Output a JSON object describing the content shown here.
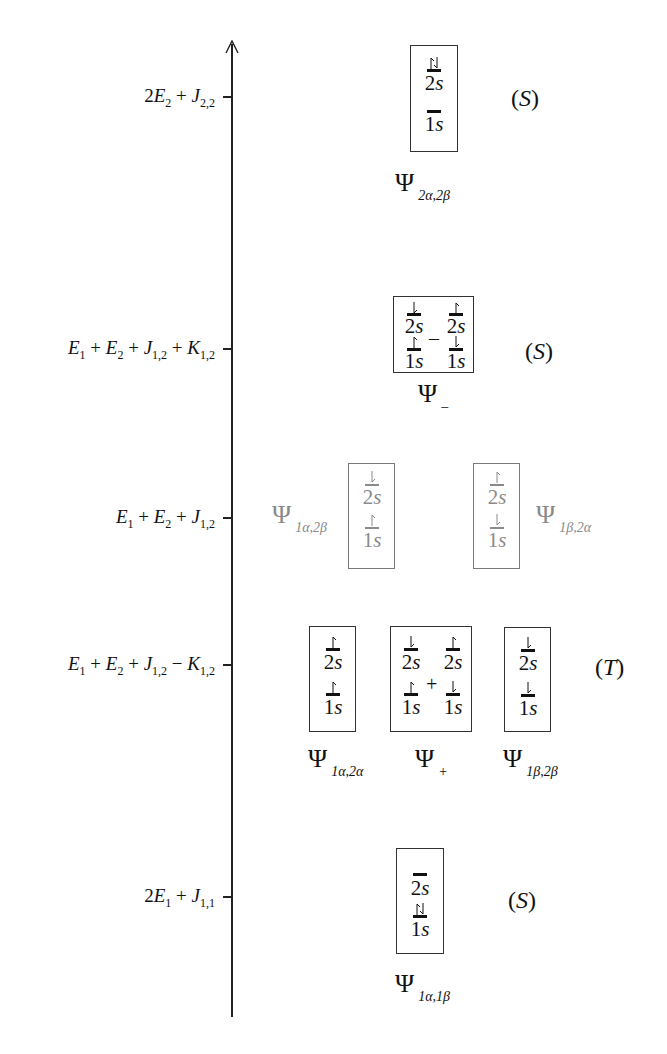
{
  "diagram": {
    "title": "",
    "axis": {
      "direction": "up",
      "meaning": "energy"
    },
    "energy_levels": [
      {
        "id": "level-2e2",
        "label_html": "2<i>E</i><sub>2</sub> + <i>J</i><sub>2,2</sub>",
        "label_text": "2E_2 + J_{2,2}",
        "y": 97
      },
      {
        "id": "level-singlet-minus",
        "label_text": "E_1 + E_2 + J_{1,2} + K_{1,2}",
        "y": 349
      },
      {
        "id": "level-coulomb",
        "label_text": "E_1 + E_2 + J_{1,2}",
        "y": 518
      },
      {
        "id": "level-triplet",
        "label_text": "E_1 + E_2 + J_{1,2} - K_{1,2}",
        "y": 665
      },
      {
        "id": "level-2e1",
        "label_text": "2E_1 + J_{1,1}",
        "y": 897
      }
    ],
    "label_parts": {
      "l0": [
        "2",
        "E",
        "2",
        " + ",
        "J",
        "2,2"
      ],
      "l1": [
        "E",
        "1",
        " + ",
        "E",
        "2",
        " + ",
        "J",
        "1,2",
        " + ",
        "K",
        "1,2"
      ],
      "l2": [
        "E",
        "1",
        " + ",
        "E",
        "2",
        " + ",
        "J",
        "1,2"
      ],
      "l3": [
        "E",
        "1",
        " + ",
        "E",
        "2",
        " + ",
        "J",
        "1,2",
        " − ",
        "K",
        "1,2"
      ],
      "l4": [
        "2",
        "E",
        "1",
        " + ",
        "J",
        "1,1"
      ]
    },
    "orbitals": {
      "upper": "2s",
      "lower": "1s",
      "upper_num": "2",
      "lower_num": "1",
      "letter": "s"
    },
    "operators": {
      "minus": "–",
      "plus": "+"
    },
    "states": [
      {
        "name": "Ψ",
        "subscript": "2α,2β",
        "multiplicity": "(S)",
        "config": {
          "2s": "↑↓",
          "1s": ""
        }
      },
      {
        "name": "Ψ",
        "subscript": "–",
        "multiplicity": "(S)",
        "config": "[2s↓,1s↑] – [2s↑,1s↓]"
      },
      {
        "name": "Ψ",
        "subscript": "1α,2β",
        "multiplicity": "",
        "config": {
          "2s": "↓",
          "1s": "↑"
        },
        "style": "gray"
      },
      {
        "name": "Ψ",
        "subscript": "1β,2α",
        "multiplicity": "",
        "config": {
          "2s": "↑",
          "1s": "↓"
        },
        "style": "gray"
      },
      {
        "name": "Ψ",
        "subscript": "1α,2α",
        "multiplicity": "(T)",
        "config": {
          "2s": "↑",
          "1s": "↑"
        }
      },
      {
        "name": "Ψ",
        "subscript": "+",
        "multiplicity": "(T)",
        "config": "[2s↓,1s↑] + [2s↑,1s↓]"
      },
      {
        "name": "Ψ",
        "subscript": "1β,2β",
        "multiplicity": "(T)",
        "config": {
          "2s": "↓",
          "1s": "↓"
        }
      },
      {
        "name": "Ψ",
        "subscript": "1α,1β",
        "multiplicity": "(S)",
        "config": {
          "2s": "",
          "1s": "↑↓"
        }
      }
    ],
    "psi": "Ψ",
    "subs": {
      "s0": "2α,2β",
      "s1": "–",
      "s2": "1α,2β",
      "s3": "1β,2α",
      "s4": "1α,2α",
      "s5": "+",
      "s6": "1β,2β",
      "s7": "1α,1β"
    },
    "mult": {
      "S": "S",
      "T": "T",
      "open": "(",
      "close": ")"
    },
    "colors": {
      "ink": "#111111",
      "faded": "#8a8a8a",
      "box": "#333333"
    }
  }
}
